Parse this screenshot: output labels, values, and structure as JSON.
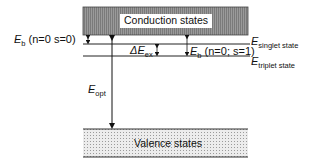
{
  "diagram": {
    "conduction_band": {
      "label": "Conduction states"
    },
    "valence_band": {
      "label": "Valence states"
    },
    "labels": {
      "eb_triplet": {
        "main": "E",
        "sub": "b",
        "rest": " (n=0  s=0)"
      },
      "eb_singlet": {
        "main": "E",
        "sub": "b",
        "rest": " (n=0; s=1)"
      },
      "delta_ex": {
        "main": "ΔE",
        "sub": "ex"
      },
      "e_singlet": {
        "main": "E",
        "sub": "singlet state"
      },
      "e_triplet": {
        "main": "E",
        "sub": "triplet state"
      },
      "e_opt": {
        "main": "E",
        "sub": "opt"
      }
    },
    "colors": {
      "band_fill": "#8a8a8a",
      "line": "#222222",
      "dots": "#bdbdbd"
    }
  }
}
